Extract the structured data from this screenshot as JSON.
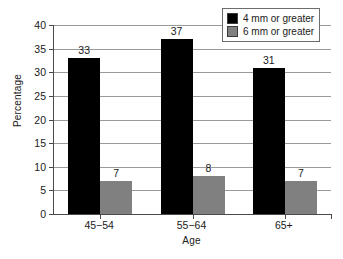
{
  "chart_data": {
    "type": "bar",
    "title": "",
    "subtitle": "",
    "xlabel": "Age",
    "ylabel": "Percentage",
    "categories": [
      "45−54",
      "55−64",
      "65+"
    ],
    "series": [
      {
        "name": "4 mm or greater",
        "color": "#000000",
        "values": [
          33,
          37,
          31
        ]
      },
      {
        "name": "6 mm or greater",
        "color": "#808080",
        "values": [
          7,
          8,
          7
        ]
      }
    ],
    "ylim": [
      0,
      40
    ],
    "ytick_step": 5,
    "yticks": [
      "0",
      "5",
      "10",
      "15",
      "20",
      "25",
      "30",
      "35",
      "40"
    ],
    "grid": "horizontal",
    "legend_position": "top-right",
    "data_labels": [
      [
        "33",
        "37",
        "31"
      ],
      [
        "7",
        "8",
        "7"
      ]
    ]
  },
  "legend": {
    "entries": [
      {
        "label": "4 mm or greater"
      },
      {
        "label": "6 mm or greater"
      }
    ]
  }
}
